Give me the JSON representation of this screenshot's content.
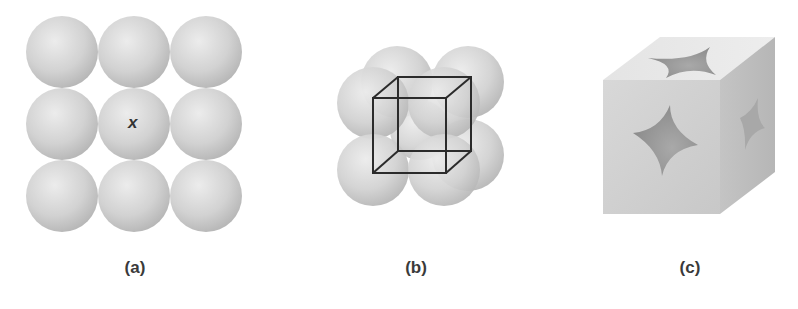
{
  "figure": {
    "panels": [
      {
        "id": "a",
        "label": "(a)",
        "description": "3x3 square layer of touching spheres",
        "center_marker": "x"
      },
      {
        "id": "b",
        "label": "(b)",
        "description": "Simple cubic arrangement of eight spheres with unit cell wireframe"
      },
      {
        "id": "c",
        "label": "(c)",
        "description": "Simple cubic unit cell cut-away solid showing sphere sections"
      }
    ],
    "colors": {
      "sphere_light": "#e6e6e6",
      "sphere_mid": "#cfcfcf",
      "sphere_dark": "#b5b5b5",
      "wire": "#2b2b2b",
      "label": "#3a3a3a"
    }
  }
}
